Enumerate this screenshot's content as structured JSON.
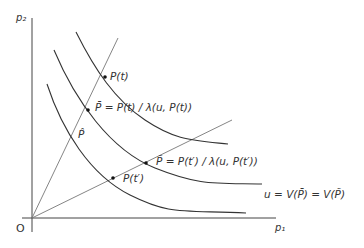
{
  "diagram": {
    "axes": {
      "x_label": "p₁",
      "y_label": "p₂",
      "origin_label": "O"
    },
    "labels": {
      "P_t": "P(t)",
      "P_bar": "P̄ = P(t) / λ(u, P(t))",
      "P_hat": "P̂",
      "P_tilde": "P̃ = P(t′) / λ(u, P(t′))",
      "P_tprime": "P(t′)",
      "indifference": "u = V(P̄) = V(P̃)"
    },
    "colors": {
      "line": "#333333",
      "ray": "#777777"
    }
  }
}
